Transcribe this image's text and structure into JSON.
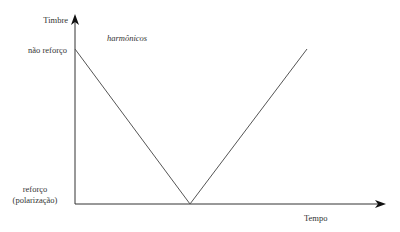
{
  "diagram": {
    "y_axis_label": "Timbre",
    "x_axis_label": "Tempo",
    "annotation": "harmônicos",
    "y_levels": {
      "top": "não reforço",
      "bottom_line1": "reforço",
      "bottom_line2": "(polarização)"
    },
    "line_color": "#555555",
    "axis_color": "#333333"
  }
}
